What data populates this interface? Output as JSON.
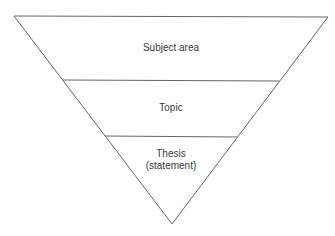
{
  "diagram": {
    "type": "inverted-pyramid",
    "levels": [
      {
        "label": "Subject area"
      },
      {
        "label": "Topic"
      },
      {
        "label_line1": "Thesis",
        "label_line2": "(statement)"
      }
    ],
    "colors": {
      "stroke": "#555555",
      "text": "#3a3a3a",
      "background": "#ffffff"
    }
  }
}
